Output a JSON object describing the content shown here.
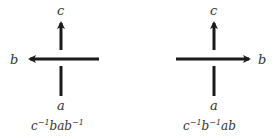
{
  "diagrams": [
    {
      "top_label": "c",
      "bottom_label": "a",
      "side_label": "b",
      "side": "left",
      "caption": {
        "p1": "c",
        "s1": "−1",
        "p2": "bab",
        "s2": "−1",
        "p3": ""
      }
    },
    {
      "top_label": "c",
      "bottom_label": "a",
      "side_label": "b",
      "side": "right",
      "caption": {
        "p1": "c",
        "s1": "−1",
        "p2": "b",
        "s2": "−1",
        "p3": "ab"
      }
    }
  ],
  "colors": {
    "stroke": "#1a1a1a",
    "text": "#333333"
  }
}
